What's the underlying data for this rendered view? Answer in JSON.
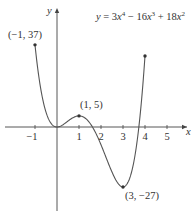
{
  "chart_data": {
    "type": "line",
    "equation": {
      "prefix": "y = 3",
      "x1": "x",
      "e1": "4",
      "mid": " − 16",
      "x2": "x",
      "e2": "3",
      "end": " + 18",
      "x3": "x",
      "e3": "2"
    },
    "xlabel": "x",
    "ylabel": "y",
    "xlim": [
      -1.5,
      5.6
    ],
    "ylim": [
      -30,
      42
    ],
    "x_ticks": [
      -1,
      1,
      2,
      3,
      4,
      5
    ],
    "x_tick_labels": [
      "−1",
      "1",
      "2",
      "3",
      "4",
      "5"
    ],
    "grid": false,
    "series": [
      {
        "name": "y = 3x^4 − 16x^3 + 18x^2",
        "x_range": [
          -1,
          4
        ],
        "color": "#555555"
      }
    ],
    "annotated_points": [
      {
        "x": -1,
        "y": 37,
        "label": "(−1, 37)"
      },
      {
        "x": 1,
        "y": 5,
        "label": "(1, 5)"
      },
      {
        "x": 3,
        "y": -27,
        "label": "(3, −27)"
      },
      {
        "x": 4,
        "y": 32,
        "label": ""
      }
    ]
  },
  "colors": {
    "curve": "#555555",
    "axis": "#444444",
    "text": "#333333"
  }
}
